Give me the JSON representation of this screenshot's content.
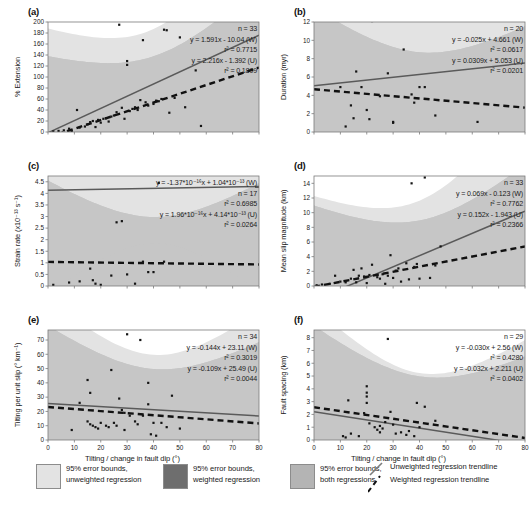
{
  "figure": {
    "xlabel": "Tilting / change in fault dip (°)",
    "x_ticks": [
      "0",
      "10",
      "20",
      "30",
      "40",
      "50",
      "60",
      "70",
      "80"
    ],
    "xlim": [
      0,
      80
    ]
  },
  "colors": {
    "band_unweighted": "#e3e3e3",
    "band_weighted": "#a9a9a9",
    "band_both": "#c6c6c6",
    "trendline": "#5a5a5a",
    "point": "#141414",
    "axis": "#7a7a7a",
    "text": "#1a1a1a"
  },
  "legend": {
    "items": [
      {
        "swatch": "#e3e3e3",
        "line1": "95% error bounds,",
        "line2": "unweighted regression"
      },
      {
        "swatch": "#6e6e6e",
        "line1": "95% error bounds,",
        "line2": "weighted regression"
      },
      {
        "swatch": "#b4b4b4",
        "line1": "95% error bounds,",
        "line2": "both regressions"
      }
    ],
    "lines": [
      {
        "label": "Unweighted regression trendline",
        "style": "solid"
      },
      {
        "label": "Weighted regression trendline",
        "style": "dashed"
      }
    ]
  },
  "chart_data": [
    {
      "panel": "a",
      "tag": "(a)",
      "type": "scatter",
      "ylabel": "% Extension",
      "xlabel": "Tilting / change in fault dip (°)",
      "ylim": [
        0,
        200
      ],
      "xlim": [
        0,
        80
      ],
      "y_ticks": [
        "0",
        "20",
        "40",
        "60",
        "80",
        "100",
        "120",
        "140",
        "160",
        "180",
        "200"
      ],
      "annotations": [
        "n = 33",
        "y = 1.591x - 10.04 (W)",
        "r² = 0.7715",
        "y = 2.216x - 1.392 (U)",
        "r² = 0.1899"
      ],
      "n": 33,
      "weighted": {
        "slope": 1.591,
        "intercept": -10.04,
        "r2": 0.7715
      },
      "unweighted": {
        "slope": 2.216,
        "intercept": -1.392,
        "r2": 0.1899
      },
      "points": [
        [
          2,
          1
        ],
        [
          4,
          2
        ],
        [
          6,
          3
        ],
        [
          8,
          6
        ],
        [
          9,
          2
        ],
        [
          11,
          40
        ],
        [
          12,
          8
        ],
        [
          14,
          10
        ],
        [
          15,
          14
        ],
        [
          16,
          18
        ],
        [
          17,
          20
        ],
        [
          18,
          9
        ],
        [
          19,
          22
        ],
        [
          20,
          17
        ],
        [
          21,
          24
        ],
        [
          22,
          25
        ],
        [
          23,
          19
        ],
        [
          24,
          28
        ],
        [
          25,
          30
        ],
        [
          26,
          36
        ],
        [
          27,
          195
        ],
        [
          28,
          44
        ],
        [
          29,
          24
        ],
        [
          30,
          129
        ],
        [
          30,
          122
        ],
        [
          31,
          38
        ],
        [
          32,
          42
        ],
        [
          33,
          45
        ],
        [
          34,
          40
        ],
        [
          35,
          58
        ],
        [
          36,
          167
        ],
        [
          37,
          54
        ],
        [
          38,
          48
        ],
        [
          40,
          51
        ],
        [
          41,
          57
        ],
        [
          42,
          56
        ],
        [
          43,
          60
        ],
        [
          44,
          186
        ],
        [
          45,
          185
        ],
        [
          46,
          35
        ],
        [
          48,
          62
        ],
        [
          50,
          172
        ],
        [
          52,
          45
        ],
        [
          56,
          112
        ],
        [
          58,
          11
        ]
      ]
    },
    {
      "panel": "b",
      "tag": "(b)",
      "type": "scatter",
      "ylabel": "Duration (myr)",
      "xlabel": "Tilting / change in fault dip (°)",
      "ylim": [
        0,
        12
      ],
      "xlim": [
        0,
        80
      ],
      "y_ticks": [
        "0",
        "2",
        "4",
        "6",
        "8",
        "10",
        "12"
      ],
      "annotations": [
        "n = 20",
        "y = -0.025x + 4.661 (W)",
        "r² = 0.0617",
        "y = 0.0309x + 5.053 (U)",
        "r² = 0.0201"
      ],
      "n": 20,
      "weighted": {
        "slope": -0.025,
        "intercept": 4.661,
        "r2": 0.0617
      },
      "unweighted": {
        "slope": 0.0309,
        "intercept": 5.053,
        "r2": 0.0201
      },
      "points": [
        [
          10,
          4.9
        ],
        [
          12,
          0.6
        ],
        [
          14,
          2.9
        ],
        [
          15,
          1.5
        ],
        [
          16,
          6.6
        ],
        [
          18,
          4.9
        ],
        [
          20,
          2.4
        ],
        [
          21,
          1.4
        ],
        [
          22,
          12.1
        ],
        [
          25,
          3.9
        ],
        [
          28,
          6.4
        ],
        [
          30,
          1.1
        ],
        [
          30,
          1.0
        ],
        [
          34,
          9.0
        ],
        [
          37,
          4.1
        ],
        [
          38,
          3.2
        ],
        [
          40,
          4.9
        ],
        [
          42,
          4.9
        ],
        [
          46,
          1.8
        ],
        [
          62,
          1.1
        ]
      ]
    },
    {
      "panel": "c",
      "tag": "(c)",
      "type": "scatter",
      "ylabel": "Strain rate (x10⁻¹³ s⁻¹)",
      "xlabel": "Tilting / change in fault dip (°)",
      "ylim": [
        0,
        4.75
      ],
      "xlim": [
        0,
        80
      ],
      "y_ticks": [
        "0",
        "0.5",
        "1",
        "1.5",
        "2",
        "2.5",
        "3",
        "3.5",
        "4",
        "4.5"
      ],
      "annotations": [
        "y = -1.37*10⁻¹⁶x + 1.04*10⁻¹³ (W)",
        "n = 17",
        "r² = 0.6985",
        "y = 1.96*10⁻¹⁶x + 4.14*10⁻¹³ (U)",
        "r² = 0.0264"
      ],
      "n": 17,
      "weighted": {
        "slope": -1.37e-16,
        "intercept": 1.04e-13,
        "r2": 0.6985
      },
      "unweighted": {
        "slope": 1.96e-16,
        "intercept": 4.14e-13,
        "r2": 0.0264
      },
      "points": [
        [
          2,
          0.05
        ],
        [
          8,
          0.15
        ],
        [
          12,
          0.2
        ],
        [
          16,
          0.75
        ],
        [
          17,
          0.25
        ],
        [
          18,
          0.1
        ],
        [
          20,
          0.05
        ],
        [
          24,
          0.45
        ],
        [
          26,
          2.75
        ],
        [
          28,
          2.8
        ],
        [
          30,
          0.5
        ],
        [
          33,
          0.1
        ],
        [
          36,
          1.05
        ],
        [
          38,
          0.6
        ],
        [
          40,
          0.6
        ],
        [
          42,
          4.45
        ],
        [
          44,
          1.05
        ]
      ]
    },
    {
      "panel": "d",
      "tag": "(d)",
      "type": "scatter",
      "ylabel": "Mean slip magnitude (km)",
      "xlabel": "Tilting / change in fault dip (°)",
      "ylim": [
        0,
        15
      ],
      "xlim": [
        0,
        80
      ],
      "y_ticks": [
        "0",
        "2",
        "4",
        "6",
        "8",
        "10",
        "12",
        "14"
      ],
      "annotations": [
        "n = 33",
        "y = 0.069x - 0.123 (W)",
        "r² = 0.7762",
        "y = 0.152x - 1.943 (U)",
        "r² = 0.2366"
      ],
      "n": 33,
      "weighted": {
        "slope": 0.069,
        "intercept": -0.123,
        "r2": 0.7762
      },
      "unweighted": {
        "slope": 0.152,
        "intercept": -1.943,
        "r2": 0.2366
      },
      "points": [
        [
          1,
          0.1
        ],
        [
          3,
          0.2
        ],
        [
          6,
          0.3
        ],
        [
          8,
          1.4
        ],
        [
          10,
          0.6
        ],
        [
          12,
          0.5
        ],
        [
          14,
          1.0
        ],
        [
          15,
          2.2
        ],
        [
          16,
          0.5
        ],
        [
          17,
          1.4
        ],
        [
          18,
          2.4
        ],
        [
          19,
          1.3
        ],
        [
          20,
          0.4
        ],
        [
          21,
          1.5
        ],
        [
          22,
          2.9
        ],
        [
          24,
          1.2
        ],
        [
          25,
          1.0
        ],
        [
          26,
          1.6
        ],
        [
          27,
          0.3
        ],
        [
          28,
          1.4
        ],
        [
          29,
          4.2
        ],
        [
          30,
          1.1
        ],
        [
          31,
          2.1
        ],
        [
          32,
          2.4
        ],
        [
          33,
          0.6
        ],
        [
          35,
          3.1
        ],
        [
          36,
          0.9
        ],
        [
          37,
          14.0
        ],
        [
          38,
          2.6
        ],
        [
          39,
          3.0
        ],
        [
          40,
          1.0
        ],
        [
          42,
          14.8
        ],
        [
          44,
          1.1
        ],
        [
          46,
          2.8
        ],
        [
          48,
          5.4
        ]
      ]
    },
    {
      "panel": "e",
      "tag": "(e)",
      "type": "scatter",
      "ylabel": "Tilting per unit slip (° km⁻¹)",
      "xlabel": "Tilting / change in fault dip (°)",
      "ylim": [
        0,
        77
      ],
      "xlim": [
        0,
        80
      ],
      "y_ticks": [
        "0",
        "10",
        "20",
        "30",
        "40",
        "50",
        "60",
        "70"
      ],
      "annotations": [
        "n = 34",
        "y = -0.144x + 23.11 (W)",
        "r² = 0.3019",
        "y = -0.109x + 25.49 (U)",
        "r² = 0.0044"
      ],
      "n": 34,
      "weighted": {
        "slope": -0.144,
        "intercept": 23.11,
        "r2": 0.3019
      },
      "unweighted": {
        "slope": -0.109,
        "intercept": 25.49,
        "r2": 0.0044
      },
      "points": [
        [
          9,
          7
        ],
        [
          12,
          26
        ],
        [
          15,
          42
        ],
        [
          15,
          13
        ],
        [
          16,
          11
        ],
        [
          16,
          33
        ],
        [
          17,
          10
        ],
        [
          18,
          9
        ],
        [
          19,
          8
        ],
        [
          20,
          12
        ],
        [
          22,
          10
        ],
        [
          23,
          9
        ],
        [
          24,
          49
        ],
        [
          25,
          12
        ],
        [
          26,
          10
        ],
        [
          27,
          29
        ],
        [
          28,
          21
        ],
        [
          29,
          19
        ],
        [
          29,
          7
        ],
        [
          30,
          74
        ],
        [
          31,
          17
        ],
        [
          33,
          13
        ],
        [
          34,
          11
        ],
        [
          35,
          70
        ],
        [
          36,
          17
        ],
        [
          38,
          40
        ],
        [
          38,
          25
        ],
        [
          39,
          4
        ],
        [
          40,
          12
        ],
        [
          41,
          3
        ],
        [
          43,
          12
        ],
        [
          45,
          9
        ],
        [
          47,
          31
        ],
        [
          50,
          8
        ]
      ]
    },
    {
      "panel": "f",
      "tag": "(f)",
      "type": "scatter",
      "ylabel": "Fault spacing (km)",
      "xlabel": "Tilting / change in fault dip (°)",
      "ylim": [
        0,
        8.6
      ],
      "xlim": [
        0,
        80
      ],
      "y_ticks": [
        "0",
        "1",
        "2",
        "3",
        "4",
        "5",
        "6",
        "7",
        "8"
      ],
      "annotations": [
        "n = 29",
        "y = -0.030x + 2.56 (W)",
        "r² = 0.4280",
        "y = -0.032x + 2.211 (U)",
        "r² = 0.0402"
      ],
      "n": 29,
      "weighted": {
        "slope": -0.03,
        "intercept": 2.56,
        "r2": 0.428
      },
      "unweighted": {
        "slope": -0.032,
        "intercept": 2.211,
        "r2": 0.0402
      },
      "points": [
        [
          11,
          0.3
        ],
        [
          13,
          3.1
        ],
        [
          14,
          0.5
        ],
        [
          17,
          0.3
        ],
        [
          19,
          2.1
        ],
        [
          20,
          4.2
        ],
        [
          20,
          3.7
        ],
        [
          20,
          3.4
        ],
        [
          20,
          2.9
        ],
        [
          21,
          1.3
        ],
        [
          23,
          1.0
        ],
        [
          24,
          0.8
        ],
        [
          25,
          1.1
        ],
        [
          25,
          0.6
        ],
        [
          26,
          0.9
        ],
        [
          27,
          1.4
        ],
        [
          28,
          7.9
        ],
        [
          29,
          2.2
        ],
        [
          30,
          1.2
        ],
        [
          31,
          0.5
        ],
        [
          33,
          0.6
        ],
        [
          35,
          0.4
        ],
        [
          36,
          0.7
        ],
        [
          38,
          0.3
        ],
        [
          39,
          2.9
        ],
        [
          40,
          1.0
        ],
        [
          42,
          2.6
        ],
        [
          46,
          1.5
        ],
        [
          12,
          0.2
        ]
      ]
    }
  ]
}
